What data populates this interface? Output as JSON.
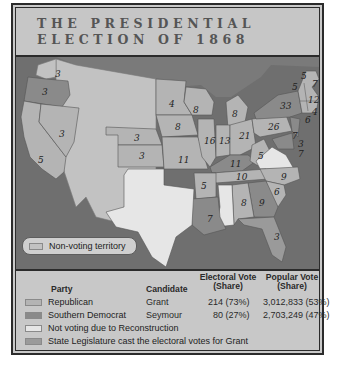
{
  "title": {
    "line1": "THE PRESIDENTIAL",
    "line2": "ELECTION OF 1868"
  },
  "colors": {
    "republican": "#b4b4b4",
    "southern_democrat": "#8a8a8a",
    "not_voting": "#e6e6e6",
    "legislature_grant": "#9a9a9a",
    "non_voting_territory": "#c2c2c2",
    "water": "#6f6f6f",
    "canada": "#7a7a7a"
  },
  "map": {
    "key_label": "Non-voting territory",
    "states": [
      {
        "state": "Washington Territory",
        "ev": "3",
        "note": "label shown"
      },
      {
        "state": "Oregon",
        "ev": "3",
        "party": "Southern Democrat"
      },
      {
        "state": "California",
        "ev": "5",
        "party": "Republican"
      },
      {
        "state": "Nevada",
        "ev": "3",
        "party": "Republican"
      },
      {
        "state": "Nebraska",
        "ev": "3",
        "party": "Republican"
      },
      {
        "state": "Kansas",
        "ev": "3",
        "party": "Republican"
      },
      {
        "state": "Minnesota",
        "ev": "4",
        "party": "Republican"
      },
      {
        "state": "Iowa",
        "ev": "8",
        "party": "Republican"
      },
      {
        "state": "Missouri",
        "ev": "11",
        "party": "Republican"
      },
      {
        "state": "Arkansas",
        "ev": "5",
        "party": "Republican"
      },
      {
        "state": "Louisiana",
        "ev": "7",
        "party": "Southern Democrat"
      },
      {
        "state": "Wisconsin",
        "ev": "8",
        "party": "Republican"
      },
      {
        "state": "Michigan",
        "ev": "8",
        "party": "Republican"
      },
      {
        "state": "Illinois",
        "ev": "16",
        "party": "Republican"
      },
      {
        "state": "Indiana",
        "ev": "13",
        "party": "Republican"
      },
      {
        "state": "Ohio",
        "ev": "21",
        "party": "Republican"
      },
      {
        "state": "Kentucky",
        "ev": "11",
        "party": "Southern Democrat"
      },
      {
        "state": "Tennessee",
        "ev": "10",
        "party": "Republican"
      },
      {
        "state": "Alabama",
        "ev": "8",
        "party": "Republican"
      },
      {
        "state": "Georgia",
        "ev": "9",
        "party": "Southern Democrat"
      },
      {
        "state": "Florida",
        "ev": "3",
        "party": "State Legislature (Grant)"
      },
      {
        "state": "South Carolina",
        "ev": "6",
        "party": "Republican"
      },
      {
        "state": "North Carolina",
        "ev": "9",
        "party": "Republican"
      },
      {
        "state": "West Virginia",
        "ev": "5",
        "party": "Republican"
      },
      {
        "state": "Pennsylvania",
        "ev": "26",
        "party": "Republican"
      },
      {
        "state": "New York",
        "ev": "33",
        "party": "Southern Democrat"
      },
      {
        "state": "Vermont",
        "ev": "5",
        "party": "Republican"
      },
      {
        "state": "New Hampshire",
        "ev": "5",
        "party": "Republican"
      },
      {
        "state": "Maine",
        "ev": "7",
        "party": "Republican"
      },
      {
        "state": "Massachusetts",
        "ev": "12",
        "party": "Republican"
      },
      {
        "state": "Rhode Island",
        "ev": "4",
        "party": "Republican"
      },
      {
        "state": "Connecticut",
        "ev": "6",
        "party": "Republican"
      },
      {
        "state": "New Jersey",
        "ev": "7",
        "party": "Southern Democrat"
      },
      {
        "state": "Delaware",
        "ev": "3",
        "party": "Southern Democrat"
      },
      {
        "state": "Maryland",
        "ev": "7",
        "party": "Southern Democrat"
      },
      {
        "state": "Texas",
        "ev": "",
        "party": "Not voting"
      },
      {
        "state": "Mississippi",
        "ev": "",
        "party": "Not voting"
      },
      {
        "state": "Virginia",
        "ev": "",
        "party": "Not voting"
      }
    ]
  },
  "legend": {
    "headers": {
      "party": "Party",
      "candidate": "Candidate",
      "electoral_line1": "Electoral Vote",
      "electoral_line2": "(Share)",
      "popular_line1": "Popular Vote",
      "popular_line2": "(Share)"
    },
    "rows": [
      {
        "party": "Republican",
        "candidate": "Grant",
        "electoral": "214 (73%)",
        "popular": "3,012,833 (53%)"
      },
      {
        "party": "Southern Democrat",
        "candidate": "Seymour",
        "electoral": "80 (27%)",
        "popular": "2,703,249 (47%)"
      },
      {
        "party": "Not voting due to Reconstruction"
      },
      {
        "party": "State Legislature cast the electoral votes for Grant"
      }
    ]
  }
}
